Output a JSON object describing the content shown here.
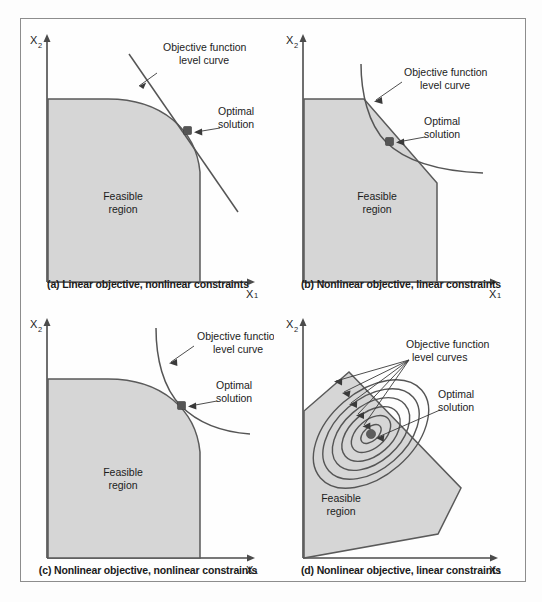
{
  "figure": {
    "background_color": "#fdfdfd",
    "frame_color": "#8d8d8d",
    "region_fill": "#d6d6d6",
    "line_color": "#555555"
  },
  "axis_labels": {
    "x_base": "X",
    "x_sub": "1",
    "y_base": "X",
    "y_sub": "2"
  },
  "common_labels": {
    "feasible_line1": "Feasible",
    "feasible_line2": "region",
    "optimal_line1": "Optimal",
    "optimal_line2": "solution",
    "level_curve_line1": "Objective function",
    "level_curve_line2": "level curve",
    "level_curves_line1": "Objective function",
    "level_curves_line2": "level curves"
  },
  "panels": [
    {
      "id": "a",
      "caption": "(a) Linear objective, nonlinear constraints",
      "objective_type": "linear",
      "constraint_type": "nonlinear",
      "level_curve_label_line1": "Objective function",
      "level_curve_label_line2": "level curve",
      "optimal_label_line1": "Optimal",
      "optimal_label_line2": "solution",
      "feasible_label_line1": "Feasible",
      "feasible_label_line2": "region"
    },
    {
      "id": "b",
      "caption": "(b) Nonlinear objective, linear constraints",
      "objective_type": "nonlinear",
      "constraint_type": "linear",
      "level_curve_label_line1": "Objective function",
      "level_curve_label_line2": "level curve",
      "optimal_label_line1": "Optimal",
      "optimal_label_line2": "solution",
      "feasible_label_line1": "Feasible",
      "feasible_label_line2": "region"
    },
    {
      "id": "c",
      "caption": "(c) Nonlinear objective, nonlinear constraints",
      "objective_type": "nonlinear",
      "constraint_type": "nonlinear",
      "level_curve_label_line1": "Objective function",
      "level_curve_label_line2": "level curve",
      "optimal_label_line1": "Optimal",
      "optimal_label_line2": "solution",
      "feasible_label_line1": "Feasible",
      "feasible_label_line2": "region"
    },
    {
      "id": "d",
      "caption": "(d) Nonlinear objective, linear constraints",
      "objective_type": "nonlinear",
      "constraint_type": "linear",
      "level_curve_label_line1": "Objective function",
      "level_curve_label_line2": "level curves",
      "optimal_label_line1": "Optimal",
      "optimal_label_line2": "solution",
      "feasible_label_line1": "Feasible",
      "feasible_label_line2": "region",
      "contour_count": 6
    }
  ]
}
